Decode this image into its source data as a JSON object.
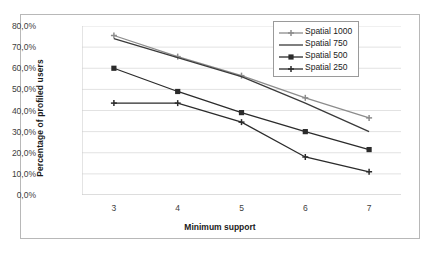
{
  "chart_data": {
    "type": "line",
    "title": "",
    "xlabel": "Minimum support",
    "ylabel": "Percentage of  profiled  users",
    "x": [
      3,
      4,
      5,
      6,
      7
    ],
    "xtick_labels": [
      "3",
      "4",
      "5",
      "6",
      "7"
    ],
    "ytick_labels": [
      "0,0%",
      "10,0%",
      "20,0%",
      "30,0%",
      "40,0%",
      "50,0%",
      "60,0%",
      "70,0%",
      "80,0%"
    ],
    "ytick_values": [
      0,
      10,
      20,
      30,
      40,
      50,
      60,
      70,
      80
    ],
    "ylim": [
      0,
      80
    ],
    "grid": true,
    "legend_position": "top-right",
    "series": [
      {
        "name": "Spatial 1000",
        "marker": "cross",
        "color": "#8c8c8c",
        "values": [
          75.5,
          65.5,
          56.5,
          46.0,
          36.5
        ]
      },
      {
        "name": "Spatial 750",
        "marker": "none",
        "color": "#3a3a3a",
        "values": [
          74.0,
          65.0,
          56.0,
          43.5,
          30.0
        ]
      },
      {
        "name": "Spatial 500",
        "marker": "square",
        "color": "#2b2b2b",
        "values": [
          60.0,
          49.0,
          39.0,
          30.0,
          21.5
        ]
      },
      {
        "name": "Spatial 250",
        "marker": "cross",
        "color": "#2b2b2b",
        "values": [
          43.5,
          43.5,
          34.5,
          18.0,
          11.0
        ]
      }
    ]
  },
  "colors": {
    "frame_border": "#b8b8b8",
    "gridline": "#e2e2e2",
    "axis_text": "#404040",
    "title_text": "#1a1a1a",
    "legend_border": "#9a9a9a",
    "background": "#ffffff"
  }
}
